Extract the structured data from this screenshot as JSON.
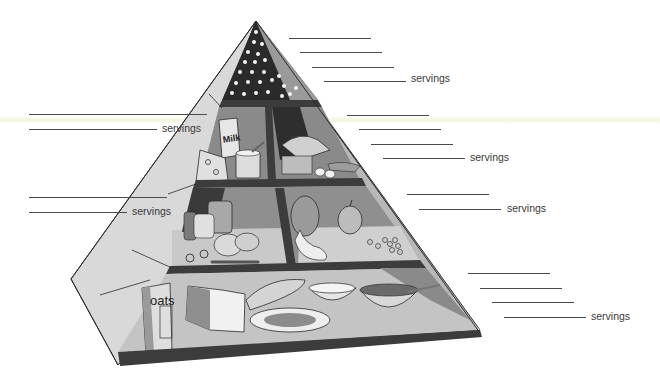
{
  "colors": {
    "outline": "#2b2b2b",
    "dark_shelf": "#3c3c3c",
    "mid_gray": "#8a8a8a",
    "light_gray": "#d6d6d6",
    "tip_dark": "#2a2a2a",
    "label": "#3a3a3a"
  },
  "tiers": [
    {
      "name": "fats-oils-sweets",
      "position": "top",
      "blank_lines": 4,
      "label": "servings"
    },
    {
      "name": "dairy",
      "position": "second-left",
      "blank_lines": 2,
      "label": "servings",
      "food_text": "Milk"
    },
    {
      "name": "meat-beans-eggs-nuts",
      "position": "second-right",
      "blank_lines": 4,
      "label": "servings"
    },
    {
      "name": "vegetables",
      "position": "third-left",
      "blank_lines": 2,
      "label": "servings"
    },
    {
      "name": "fruits",
      "position": "third-right",
      "blank_lines": 2,
      "label": "servings"
    },
    {
      "name": "grains",
      "position": "bottom",
      "blank_lines": 4,
      "label": "servings",
      "food_text": "oats"
    }
  ],
  "labels": {
    "top": "servings",
    "dairy": "servings",
    "meat": "servings",
    "vegetables": "servings",
    "fruits": "servings",
    "grains": "servings"
  },
  "food_text": {
    "milk": "Milk",
    "oats": "oats"
  }
}
